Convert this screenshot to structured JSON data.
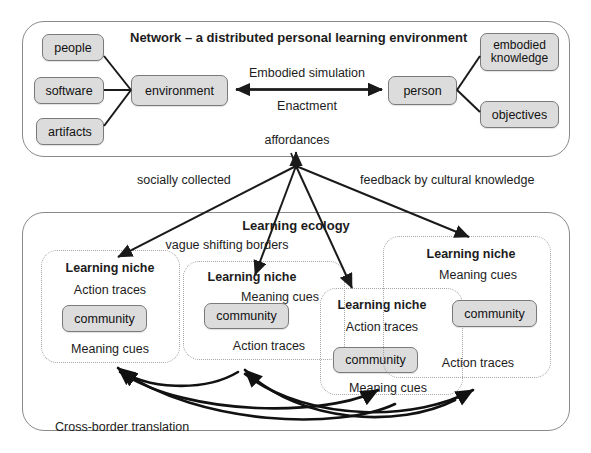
{
  "diagram": {
    "network": {
      "title": "Network – a distributed personal learning environment",
      "left_inputs": [
        {
          "label": "people"
        },
        {
          "label": "software"
        },
        {
          "label": "artifacts"
        }
      ],
      "center_left": {
        "label": "environment"
      },
      "center_right": {
        "label": "person"
      },
      "right_outputs": [
        {
          "label": "embodied knowledge"
        },
        {
          "label": "objectives"
        }
      ],
      "relation_top": "Embodied simulation",
      "relation_bottom": "Enactment",
      "affordances": "affordances"
    },
    "connectors": {
      "socially_collected": "socially collected",
      "feedback": "feedback by cultural knowledge",
      "cross_border": "Cross-border translation"
    },
    "ecology": {
      "title": "Learning ecology",
      "borders_note": "vague shifting borders",
      "niches": [
        {
          "title": "Learning niche",
          "top_label": "Action traces",
          "community": "community",
          "bottom_label": "Meaning cues"
        },
        {
          "title": "Learning niche",
          "top_label": "Meaning cues",
          "community": "community",
          "bottom_label": "Action traces"
        },
        {
          "title": "Learning niche",
          "top_label": "Action traces",
          "community": "community",
          "bottom_label": "Meaning cues"
        },
        {
          "title": "Learning niche",
          "top_label": "Meaning cues",
          "community": "community",
          "bottom_label": "Action traces"
        }
      ]
    },
    "colors": {
      "node_fill": "#dcdcdc",
      "node_border": "#7a7a7a",
      "outer_border": "#8a8a8a",
      "niche_border": "#a5a5a5",
      "arrow": "#1a1a1a",
      "text": "#1c1c1c"
    }
  }
}
